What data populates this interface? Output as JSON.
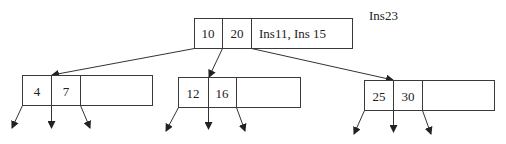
{
  "diagram": {
    "type": "b-tree",
    "annotation": "Ins23",
    "root": {
      "keys": [
        "10",
        "20"
      ],
      "note": "Ins11, Ins 15"
    },
    "children": [
      {
        "keys": [
          "4",
          "7"
        ]
      },
      {
        "keys": [
          "12",
          "16"
        ]
      },
      {
        "keys": [
          "25",
          "30"
        ]
      }
    ],
    "colors": {
      "stroke": "#3a3a3a",
      "text": "#222222",
      "background": "#ffffff"
    }
  }
}
